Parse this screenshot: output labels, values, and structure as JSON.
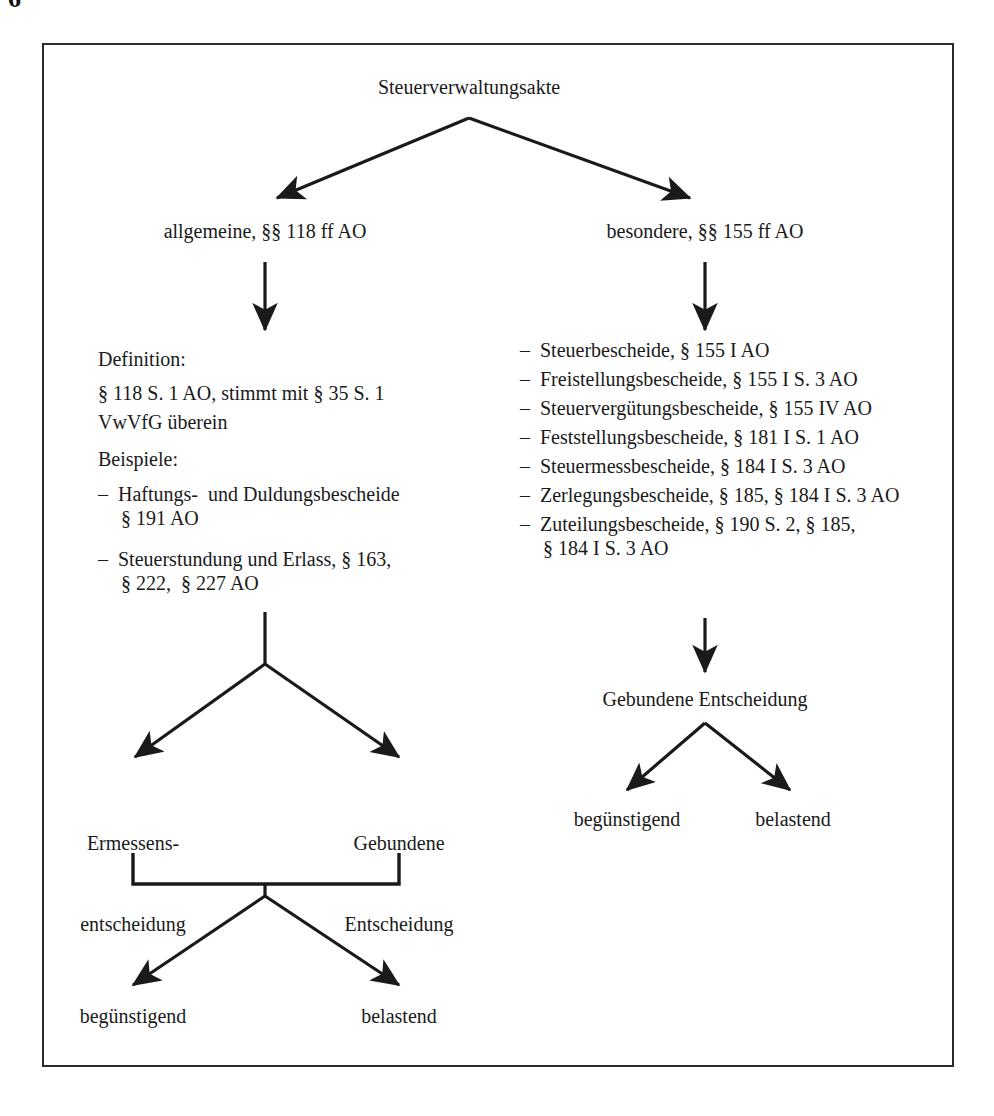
{
  "page": {
    "page_number": "6"
  },
  "diagram": {
    "title": "Steuerverwaltungsakte",
    "branch_left_label": "allgemeine, §§ 118 ff AO",
    "branch_right_label": "besondere, §§ 155 ff AO",
    "left_column": {
      "definition_heading": "Definition:",
      "definition_line1": "§ 118 S. 1 AO, stimmt mit § 35 S. 1",
      "definition_line2": "VwVfG übereinstimmt",
      "definition_text_line1": "§ 118 S. 1 AO, stimmt mit § 35 S. 1",
      "definition_text_line2": "VwVfG überein",
      "examples_heading": "Beispiele:",
      "examples": [
        {
          "dash": "–",
          "line1": "Haftungs-  und Duldungsbescheide",
          "line2": "§ 191 AO"
        },
        {
          "dash": "–",
          "line1": "Steuerstundung und Erlass, § 163,",
          "line2": "§ 222,  § 227 AO"
        }
      ],
      "decision_left_line1": "Ermessens-",
      "decision_left_line2": "entscheidung",
      "decision_right_line1": "Gebundene",
      "decision_right_line2": "Entscheidung",
      "outcome_left": "begünstigend",
      "outcome_right": "belastend"
    },
    "right_column": {
      "dash": "–",
      "items": [
        {
          "dash": "–",
          "text": "Steuerbescheide, § 155 I AO"
        },
        {
          "dash": "–",
          "text": "Freistellungsbescheide, § 155 I S. 3 AO"
        },
        {
          "dash": "–",
          "text": "Steuervergütungsbescheide, § 155 IV AO"
        },
        {
          "dash": "–",
          "text": "Feststellungsbescheide, § 181 I S. 1 AO"
        },
        {
          "dash": "–",
          "text": "Steuermessbescheide, § 184 I S. 3 AO"
        },
        {
          "dash": "–",
          "text": "Zerlegungsbescheide, § 185, § 184 I S. 3 AO"
        },
        {
          "dash": "–",
          "text": "Zuteilungsbescheide, § 190 S. 2, § 185,"
        }
      ],
      "last_item_continuation": "§ 184 I S. 3 AO",
      "bound_decision": "Gebundene Entscheidung",
      "outcome_left": "begünstigend",
      "outcome_right": "belastend"
    }
  },
  "colors": {
    "ink": "#1a1a1a",
    "frame": "#2b2b2b",
    "background": "#ffffff"
  }
}
